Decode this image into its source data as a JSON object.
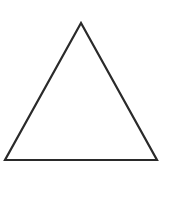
{
  "diagram": {
    "shape": "triangle",
    "type": "equilateral-outline",
    "vertices": [
      [
        81,
        23
      ],
      [
        5,
        160
      ],
      [
        157,
        160
      ]
    ],
    "stroke_color": "#2a2a2a",
    "stroke_width": 2.2,
    "fill": "#ffffff"
  }
}
